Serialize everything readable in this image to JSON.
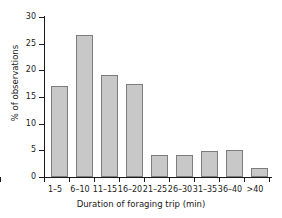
{
  "chart_data": {
    "type": "bar",
    "title": "",
    "xlabel": "Duration of foraging trip (min)",
    "ylabel": "% of observations",
    "categories": [
      "1–5",
      "6–10",
      "11–15",
      "16–20",
      "21–25",
      "26–30",
      "31–35",
      "36–40",
      ">40"
    ],
    "values": [
      17.0,
      26.6,
      19.1,
      17.5,
      4.1,
      4.1,
      4.8,
      5.0,
      1.7
    ],
    "ylim": [
      0,
      30
    ],
    "ytick_labels": [
      "0",
      "5",
      "10",
      "15",
      "20",
      "25",
      "30"
    ],
    "ytick_values": [
      0,
      5,
      10,
      15,
      20,
      25,
      30
    ],
    "grid": false,
    "legend": false,
    "bar_fill_color": "#c8c8c8",
    "bar_edge_color": "#7d7d7d",
    "axis_color": "#1a1a1a",
    "background_color": "#ffffff"
  }
}
